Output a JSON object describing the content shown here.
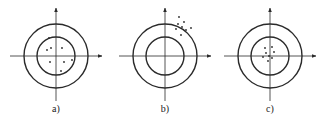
{
  "diagram": {
    "type": "target-accuracy-precision",
    "colors": {
      "stroke": "#2a2a2a",
      "dot": "#2a2a2a",
      "background": "#ffffff"
    },
    "outer_radius": 32,
    "inner_radius": 19,
    "panels": [
      {
        "label": "a)",
        "center": [
          56,
          56
        ],
        "dots": [
          [
            49,
            38
          ],
          [
            51,
            48
          ],
          [
            47,
            50
          ],
          [
            62,
            48
          ],
          [
            50,
            62
          ],
          [
            64,
            62
          ],
          [
            72,
            60
          ],
          [
            61,
            71
          ]
        ]
      },
      {
        "label": "b)",
        "center": [
          165,
          56
        ],
        "dots": [
          [
            179,
            17
          ],
          [
            184,
            22
          ],
          [
            178,
            24
          ],
          [
            182,
            27
          ],
          [
            191,
            28
          ],
          [
            176,
            29
          ],
          [
            186,
            30
          ],
          [
            181,
            35
          ]
        ]
      },
      {
        "label": "c)",
        "center": [
          270,
          56
        ],
        "dots": [
          [
            265,
            48
          ],
          [
            272,
            47
          ],
          [
            266,
            53
          ],
          [
            274,
            52
          ],
          [
            263,
            57
          ],
          [
            269,
            56
          ],
          [
            272,
            58
          ],
          [
            268,
            61
          ]
        ]
      }
    ]
  }
}
